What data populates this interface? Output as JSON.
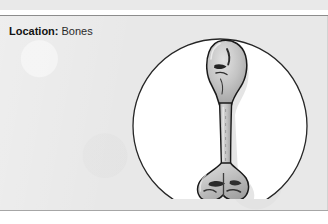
{
  "page": {
    "background_color": "#ffffff",
    "card_background_color": "#e8e8e8",
    "card_border_color": "#8c8c8c"
  },
  "top_strip": {
    "clipped_text": "CLIPPED HEADING TEXT",
    "note": "partially cropped line of text at the top edge, only faint descenders visible"
  },
  "label": {
    "key": "Location:",
    "value": "Bones"
  },
  "illustration": {
    "name": "long-bone-diagram",
    "shape": "circle",
    "circle_fill": "#ffffff",
    "circle_stroke": "#262626",
    "bone_fill": "#c9c9c9",
    "bone_stroke": "#1a1a1a",
    "bone_shadow": "#9a9a9a",
    "caption": "Long bone (humerus) shown inside a circular inset"
  }
}
